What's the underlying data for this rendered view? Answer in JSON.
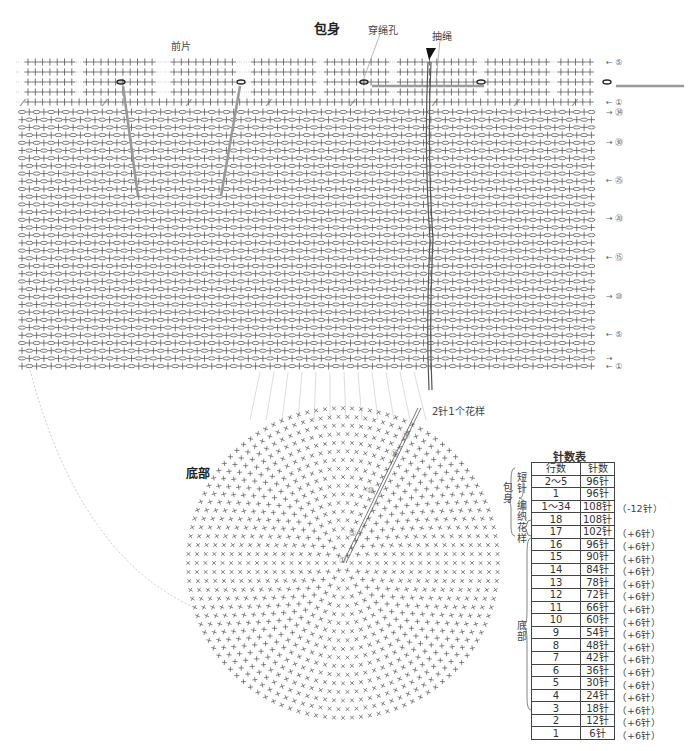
{
  "header": {
    "body_title": "包身",
    "front_label": "前片",
    "eyelet_label": "穿绳孔",
    "drawstring_label": "抽绳",
    "repeat_label": "2针1个花样"
  },
  "bottom": {
    "title": "底部",
    "radial_markers": [
      "⑱",
      "⑮",
      "⑩",
      "⑤",
      "①"
    ]
  },
  "grid": {
    "row_markers": [
      {
        "row": 5,
        "label": "← ⑤",
        "section": "short"
      },
      {
        "row": 1,
        "label": "← ①",
        "section": "short"
      },
      {
        "row": 34,
        "label": "→ ㉞",
        "section": "pattern"
      },
      {
        "row": 30,
        "label": "→ ㉚",
        "section": "pattern"
      },
      {
        "row": 25,
        "label": "← ㉕",
        "section": "pattern"
      },
      {
        "row": 20,
        "label": "→ ⑳",
        "section": "pattern"
      },
      {
        "row": 15,
        "label": "← ⑮",
        "section": "pattern"
      },
      {
        "row": 10,
        "label": "→ ⑩",
        "section": "pattern"
      },
      {
        "row": 5,
        "label": "← ⑤",
        "section": "pattern"
      },
      {
        "row": 2,
        "label": "→",
        "section": "pattern"
      },
      {
        "row": 1,
        "label": "← ①",
        "section": "pattern"
      }
    ],
    "short_rows": 5,
    "pattern_rows": 34
  },
  "stitch_table": {
    "title": "针数表",
    "headers": [
      "行数",
      "针数"
    ],
    "groups": {
      "body": "包身",
      "short": "短针",
      "pattern": "编织花样",
      "bottom": "底部"
    },
    "rows": [
      {
        "rows": "2～5",
        "stitches": "96针",
        "note": ""
      },
      {
        "rows": "1",
        "stitches": "96针",
        "note": "（-12针）"
      },
      {
        "rows": "1～34",
        "stitches": "108针",
        "note": ""
      },
      {
        "rows": "18",
        "stitches": "108针",
        "note": "（+6针）"
      },
      {
        "rows": "17",
        "stitches": "102针",
        "note": "（+6针）"
      },
      {
        "rows": "16",
        "stitches": "96针",
        "note": "（+6针）"
      },
      {
        "rows": "15",
        "stitches": "90针",
        "note": "（+6针）"
      },
      {
        "rows": "14",
        "stitches": "84针",
        "note": "（+6针）"
      },
      {
        "rows": "13",
        "stitches": "78针",
        "note": "（+6针）"
      },
      {
        "rows": "12",
        "stitches": "72针",
        "note": "（+6针）"
      },
      {
        "rows": "11",
        "stitches": "66针",
        "note": "（+6针）"
      },
      {
        "rows": "10",
        "stitches": "60针",
        "note": "（+6针）"
      },
      {
        "rows": "9",
        "stitches": "54针",
        "note": "（+6针）"
      },
      {
        "rows": "8",
        "stitches": "48针",
        "note": "（+6针）"
      },
      {
        "rows": "7",
        "stitches": "42针",
        "note": "（+6针）"
      },
      {
        "rows": "6",
        "stitches": "36针",
        "note": "（+6针）"
      },
      {
        "rows": "5",
        "stitches": "30针",
        "note": "（+6针）"
      },
      {
        "rows": "4",
        "stitches": "24针",
        "note": "（+6针）"
      },
      {
        "rows": "3",
        "stitches": "18针",
        "note": "（+6针）"
      },
      {
        "rows": "2",
        "stitches": "12针",
        "note": "（+6针）"
      },
      {
        "rows": "1",
        "stitches": "6针",
        "note": ""
      }
    ]
  },
  "colors": {
    "ink": "#555555",
    "strap": "#9a9a9a",
    "dotted": "#aaaaaa"
  }
}
